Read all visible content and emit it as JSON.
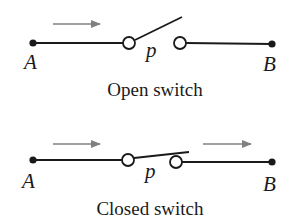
{
  "open_switch": {
    "caption": "Open switch",
    "label_start": "A",
    "label_end": "B",
    "switch_label": "p",
    "state": "open",
    "arrows": 1
  },
  "closed_switch": {
    "caption": "Closed switch",
    "label_start": "A",
    "label_end": "B",
    "switch_label": "p",
    "state": "closed",
    "arrows": 2
  },
  "colors": {
    "wire": "#1a1a1a",
    "arrow": "#808080"
  }
}
